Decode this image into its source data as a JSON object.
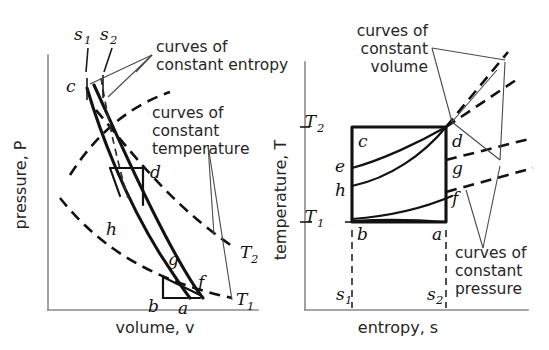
{
  "figure": {
    "background": "#ffffff",
    "ink": "#121212"
  },
  "left_plot": {
    "name": "pressure-volume diagram",
    "y_axis_label": "pressure, P",
    "x_axis_label": "volume, v",
    "state_points": [
      {
        "id": "c",
        "label": "c"
      },
      {
        "id": "d",
        "label": "d"
      },
      {
        "id": "h",
        "label": "h"
      },
      {
        "id": "g",
        "label": "g"
      },
      {
        "id": "f",
        "label": "f"
      },
      {
        "id": "b",
        "label": "b"
      },
      {
        "id": "a",
        "label": "a"
      }
    ],
    "entropy_labels": [
      {
        "id": "s1",
        "base": "s",
        "sub": "1"
      },
      {
        "id": "s2",
        "base": "s",
        "sub": "2"
      }
    ],
    "isotherm_labels": [
      {
        "id": "T2",
        "base": "T",
        "sub": "2"
      },
      {
        "id": "T1",
        "base": "T",
        "sub": "1"
      }
    ],
    "annotations": [
      {
        "id": "constant-entropy",
        "lines": [
          "curves of",
          "constant entropy"
        ],
        "align": "left"
      },
      {
        "id": "constant-temperature",
        "lines": [
          "curves of",
          "constant",
          "temperature"
        ],
        "align": "left"
      }
    ]
  },
  "right_plot": {
    "name": "temperature-entropy diagram",
    "y_axis_label": "temperature, T",
    "x_axis_label": "entropy, s",
    "state_points": [
      {
        "id": "c",
        "label": "c"
      },
      {
        "id": "d",
        "label": "d"
      },
      {
        "id": "e",
        "label": "e"
      },
      {
        "id": "h",
        "label": "h"
      },
      {
        "id": "g",
        "label": "g"
      },
      {
        "id": "f",
        "label": "f"
      },
      {
        "id": "b",
        "label": "b"
      },
      {
        "id": "a",
        "label": "a"
      }
    ],
    "temperature_labels": [
      {
        "id": "T2",
        "base": "T",
        "sub": "2"
      },
      {
        "id": "T1",
        "base": "T",
        "sub": "1"
      }
    ],
    "entropy_labels": [
      {
        "id": "s1",
        "base": "s",
        "sub": "1"
      },
      {
        "id": "s2",
        "base": "s",
        "sub": "2"
      }
    ],
    "annotations": [
      {
        "id": "constant-volume",
        "lines": [
          "curves of",
          "constant",
          "volume"
        ],
        "align": "right"
      },
      {
        "id": "constant-pressure",
        "lines": [
          "curves of",
          "constant",
          "pressure"
        ],
        "align": "left"
      }
    ]
  }
}
